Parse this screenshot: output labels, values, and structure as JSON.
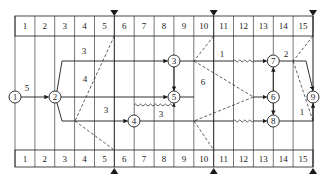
{
  "diagram": {
    "type": "time-scaled network diagram",
    "time_units": [
      "1",
      "2",
      "3",
      "4",
      "5",
      "6",
      "7",
      "8",
      "9",
      "10",
      "11",
      "12",
      "13",
      "14",
      "15"
    ],
    "checkpoints": [
      5,
      10,
      15
    ],
    "nodes": [
      {
        "id": "1",
        "label": "1",
        "col": 0,
        "row": "mid"
      },
      {
        "id": "2",
        "label": "2",
        "col": 2,
        "row": "mid"
      },
      {
        "id": "3",
        "label": "3",
        "col": 8,
        "row": "top"
      },
      {
        "id": "4",
        "label": "4",
        "col": 6,
        "row": "low"
      },
      {
        "id": "5",
        "label": "5",
        "col": 8,
        "row": "mid"
      },
      {
        "id": "6",
        "label": "6",
        "col": 13,
        "row": "mid"
      },
      {
        "id": "7",
        "label": "7",
        "col": 13,
        "row": "top"
      },
      {
        "id": "8",
        "label": "8",
        "col": 13,
        "row": "low"
      },
      {
        "id": "9",
        "label": "9",
        "col": 15,
        "row": "mid"
      }
    ],
    "edge_labels": {
      "e12": "5",
      "e23": "3",
      "e25": "4",
      "e24": "3",
      "e45": "3",
      "e37": "1",
      "e56": "6",
      "e79": "2",
      "e89": "1"
    }
  }
}
